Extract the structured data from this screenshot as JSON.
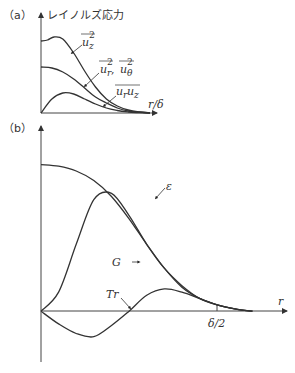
{
  "chart_data": [
    {
      "panel": "(a)",
      "type": "line",
      "title": "レイノルズ応力",
      "xlabel": "r/δ",
      "ylabel": "レイノルズ応力",
      "xlim": [
        0,
        1
      ],
      "ylim": [
        0,
        1
      ],
      "grid": false,
      "legend": "inline-annotations",
      "series": [
        {
          "name": "u_z^2 (mean)",
          "label": "u_z²",
          "x": [
            0,
            0.06,
            0.12,
            0.2,
            0.3,
            0.4,
            0.5,
            0.6,
            0.7,
            0.8,
            0.9,
            1.0
          ],
          "y": [
            0.72,
            0.73,
            0.76,
            0.74,
            0.6,
            0.42,
            0.26,
            0.14,
            0.07,
            0.03,
            0.01,
            0.0
          ]
        },
        {
          "name": "u_r^2, u_θ^2 (mean)",
          "label": "u_r², u_θ²",
          "x": [
            0,
            0.1,
            0.2,
            0.3,
            0.4,
            0.5,
            0.6,
            0.7,
            0.8,
            0.9,
            1.0
          ],
          "y": [
            0.46,
            0.45,
            0.41,
            0.34,
            0.25,
            0.16,
            0.1,
            0.05,
            0.02,
            0.01,
            0.0
          ]
        },
        {
          "name": "u_r u_z (mean)",
          "label": "u_r u_z",
          "x": [
            0,
            0.1,
            0.2,
            0.3,
            0.4,
            0.5,
            0.6,
            0.7,
            0.8,
            0.9,
            1.0
          ],
          "y": [
            0.0,
            0.14,
            0.2,
            0.19,
            0.14,
            0.09,
            0.05,
            0.025,
            0.01,
            0.003,
            0.0
          ]
        }
      ]
    },
    {
      "panel": "(b)",
      "type": "line",
      "title": "",
      "xlabel": "r",
      "ylabel": "",
      "xlim": [
        0,
        1.3
      ],
      "ylim": [
        -0.25,
        1.15
      ],
      "grid": false,
      "xticks": [
        {
          "value": 0.5,
          "label": "δ/2"
        }
      ],
      "legend": "inline-annotations",
      "series": [
        {
          "name": "ε",
          "label": "ε",
          "x": [
            0,
            0.1,
            0.2,
            0.3,
            0.4,
            0.5,
            0.6,
            0.7,
            0.8,
            0.9,
            1.0,
            1.1,
            1.2
          ],
          "y": [
            0.92,
            0.91,
            0.88,
            0.82,
            0.72,
            0.58,
            0.42,
            0.27,
            0.15,
            0.08,
            0.04,
            0.015,
            0.0
          ]
        },
        {
          "name": "G",
          "label": "G",
          "x": [
            0,
            0.1,
            0.2,
            0.3,
            0.4,
            0.5,
            0.6,
            0.7,
            0.8,
            0.9,
            1.0,
            1.1,
            1.2
          ],
          "y": [
            0.0,
            0.12,
            0.42,
            0.7,
            0.74,
            0.6,
            0.42,
            0.27,
            0.16,
            0.08,
            0.04,
            0.015,
            0.0
          ]
        },
        {
          "name": "Tr",
          "label": "Tr",
          "x": [
            0,
            0.1,
            0.2,
            0.3,
            0.4,
            0.5,
            0.6,
            0.7,
            0.8,
            0.9,
            1.0,
            1.1,
            1.2
          ],
          "y": [
            0.0,
            -0.08,
            -0.14,
            -0.16,
            -0.09,
            0.0,
            0.1,
            0.14,
            0.12,
            0.08,
            0.04,
            0.015,
            0.0
          ]
        }
      ]
    }
  ],
  "labels": {
    "panel_a": "（a）",
    "panel_b": "（b）",
    "a_ylabel": "レイノルズ応力",
    "a_xlabel": "r/δ",
    "a_uz2": "u",
    "a_uz2_sub": "z",
    "a_uz2_sup": "2",
    "a_urut": "u",
    "a_ur_sub": "r",
    "a_sep": " , ",
    "a_ut_sub": "θ",
    "a_urut_sup": "2",
    "a_uruz": "u",
    "a_uruz_sub1": "r",
    "a_uruz_sub2": "z",
    "b_eps": "ε",
    "b_g": "G",
    "b_tr": "Tr",
    "b_xlabel": "r",
    "b_tick": "δ/2"
  }
}
